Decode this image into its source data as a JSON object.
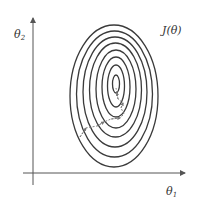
{
  "diagram": {
    "title_label": "J(θ)",
    "x_axis_label": "θ",
    "x_axis_sub": "1",
    "y_axis_label": "θ",
    "y_axis_sub": "2",
    "contour_count": 8,
    "path_description": "gradient descent path (dashed arrows) from lower-left toward minimum at center",
    "colors": {
      "contour": "#3a3a3a",
      "axis": "#555555",
      "path": "#777777",
      "background": "#ffffff"
    }
  }
}
